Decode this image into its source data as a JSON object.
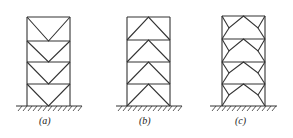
{
  "figure": {
    "frames": [
      {
        "id": "a",
        "label": "(a)",
        "bracing": "inverted-V (V-bracing)",
        "stories": 4
      },
      {
        "id": "b",
        "label": "(b)",
        "bracing": "chevron (inverted-V / Λ bracing)",
        "stories": 4
      },
      {
        "id": "c",
        "label": "(c)",
        "bracing": "eccentric knee bracing",
        "stories": 4
      }
    ]
  }
}
